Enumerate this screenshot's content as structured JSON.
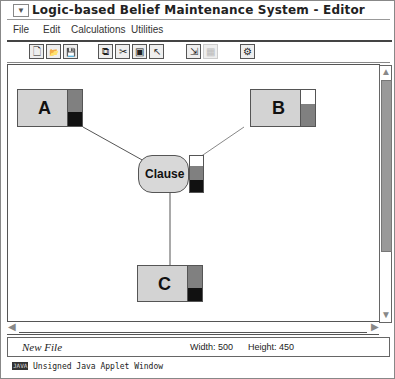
{
  "window": {
    "title": "Logic-based Belief Maintenance System - Editor",
    "system_menu_glyph": "▼"
  },
  "menubar": {
    "items": [
      {
        "label": "File"
      },
      {
        "label": "Edit"
      },
      {
        "label": "Calculations"
      },
      {
        "label": "Utilities"
      }
    ]
  },
  "toolbar": {
    "buttons": [
      {
        "name": "new-file",
        "glyph": "🗋"
      },
      {
        "name": "open-file",
        "glyph": "📂"
      },
      {
        "name": "save-file",
        "glyph": "💾"
      },
      {
        "name": "copy",
        "glyph": "⧉"
      },
      {
        "name": "cut",
        "glyph": "✂"
      },
      {
        "name": "select-node",
        "glyph": "▣"
      },
      {
        "name": "cut-pointer",
        "glyph": "↖"
      },
      {
        "name": "arrange",
        "glyph": "⇲"
      },
      {
        "name": "grid",
        "glyph": "▦"
      },
      {
        "name": "settings",
        "glyph": "⚙"
      }
    ]
  },
  "canvas": {
    "nodes": [
      {
        "id": "A",
        "label": "A",
        "bar": [
          "#808080",
          "#111111"
        ]
      },
      {
        "id": "B",
        "label": "B",
        "bar": [
          "#ffffff",
          "#808080"
        ]
      },
      {
        "id": "C",
        "label": "C",
        "bar": [
          "#808080",
          "#111111"
        ]
      }
    ],
    "clause": {
      "label": "Clause",
      "bar": [
        "#ffffff",
        "#808080",
        "#111111"
      ]
    }
  },
  "colors": {
    "node_fill": "#d3d3d3",
    "clause_fill": "#d8d8d8",
    "scroll_thumb": "#999999"
  },
  "status": {
    "file_name": "New File",
    "width_label": "Width: 500",
    "height_label": "Height: 450"
  },
  "footer": {
    "badge": "JAVA",
    "text": "Unsigned Java Applet Window"
  }
}
